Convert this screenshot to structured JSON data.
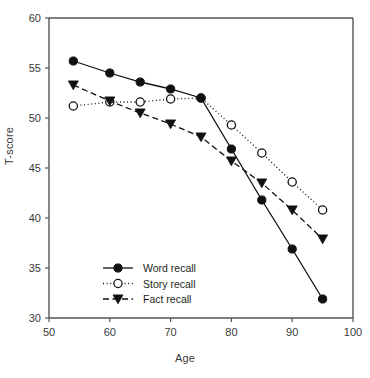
{
  "chart_data": {
    "type": "line",
    "title": "",
    "xlabel": "Age",
    "ylabel": "T-score",
    "xlim": [
      50,
      100
    ],
    "ylim": [
      30,
      60
    ],
    "xticks": [
      50,
      60,
      70,
      80,
      90,
      100
    ],
    "yticks": [
      30,
      35,
      40,
      45,
      50,
      55,
      60
    ],
    "grid": false,
    "legend_position": "lower-left-inside",
    "x": [
      54,
      60,
      65,
      70,
      75,
      80,
      85,
      90,
      95
    ],
    "series": [
      {
        "name": "Word recall",
        "marker": "filled-circle",
        "line": "solid",
        "values": [
          55.7,
          54.5,
          53.6,
          52.9,
          52.0,
          46.9,
          41.8,
          36.9,
          31.9
        ]
      },
      {
        "name": "Story recall",
        "marker": "open-circle",
        "line": "dotted",
        "values": [
          51.2,
          51.6,
          51.6,
          51.9,
          52.0,
          49.3,
          46.5,
          43.6,
          40.8
        ]
      },
      {
        "name": "Fact recall",
        "marker": "filled-triangle-down",
        "line": "dashed",
        "values": [
          53.3,
          51.7,
          50.5,
          49.4,
          48.1,
          45.7,
          43.5,
          40.8,
          37.9
        ]
      }
    ]
  },
  "legend": {
    "items": [
      {
        "label": "Word recall"
      },
      {
        "label": "Story recall"
      },
      {
        "label": "Fact recall"
      }
    ]
  },
  "colors": {
    "axis": "#555555",
    "series": "#111111",
    "background": "#ffffff",
    "tick_text": "#3a3a3a"
  }
}
